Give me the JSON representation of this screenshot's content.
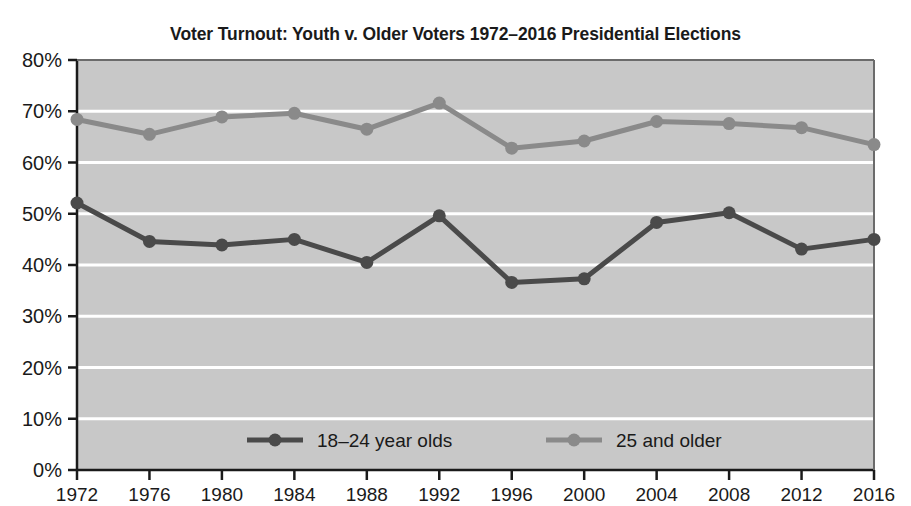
{
  "chart_data": {
    "type": "line",
    "title": "Voter Turnout: Youth v. Older Voters 1972–2016 Presidential Elections",
    "xlabel": "",
    "ylabel": "",
    "categories": [
      "1972",
      "1976",
      "1980",
      "1984",
      "1988",
      "1992",
      "1996",
      "2000",
      "2004",
      "2008",
      "2012",
      "2016"
    ],
    "series": [
      {
        "name": "18–24 year olds",
        "color": "#4a4a4a",
        "values": [
          52.1,
          44.6,
          43.9,
          45.0,
          40.5,
          49.6,
          36.6,
          37.3,
          48.3,
          50.2,
          43.1,
          45.0
        ]
      },
      {
        "name": "25 and older",
        "color": "#8a8a8a",
        "values": [
          68.4,
          65.5,
          68.9,
          69.6,
          66.5,
          71.6,
          62.8,
          64.2,
          68.0,
          67.6,
          66.8,
          63.5
        ]
      }
    ],
    "ylim": [
      0,
      80
    ],
    "yticks": [
      0,
      10,
      20,
      30,
      40,
      50,
      60,
      70,
      80
    ],
    "ytick_labels": [
      "0%",
      "10%",
      "20%",
      "30%",
      "40%",
      "50%",
      "60%",
      "70%",
      "80%"
    ],
    "grid": true,
    "gridline_color": "#ffffff",
    "plot_background": "#c8c8c8",
    "legend_position": "inside-bottom-center",
    "legend": [
      {
        "label": "18–24 year olds",
        "color": "#4a4a4a"
      },
      {
        "label": "25 and older",
        "color": "#8a8a8a"
      }
    ]
  }
}
